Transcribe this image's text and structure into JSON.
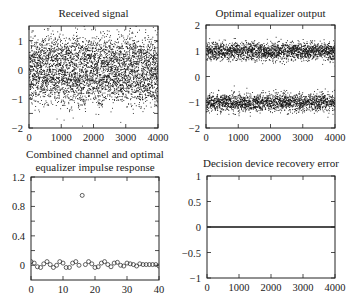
{
  "chart_data": [
    {
      "id": "received",
      "type": "scatter",
      "title": "Received signal",
      "xlabel": "",
      "ylabel": "",
      "xlim": [
        0,
        4000
      ],
      "ylim": [
        -2,
        1.5
      ],
      "xticks": [
        0,
        1000,
        2000,
        3000,
        4000
      ],
      "yticks": [
        -2,
        -1,
        0,
        1
      ],
      "xtick_labels": [
        "0",
        "1000",
        "2000",
        "3000",
        "4000"
      ],
      "ytick_labels": [
        "−2",
        "−1",
        "0",
        "1"
      ],
      "n_points": 4000,
      "description": "Dense cloud of dots centered near 0, mostly within about -1 to 1, occasional outliers to about -1.5 and 1.4",
      "approx_mean": 0,
      "approx_spread": [
        -1.3,
        1.4
      ],
      "grid": false,
      "legend": null
    },
    {
      "id": "equalizer_output",
      "type": "scatter",
      "title": "Optimal equalizer output",
      "xlabel": "",
      "ylabel": "",
      "xlim": [
        0,
        4000
      ],
      "ylim": [
        -2,
        2
      ],
      "xticks": [
        0,
        1000,
        2000,
        3000,
        4000
      ],
      "yticks": [
        -2,
        -1,
        0,
        1,
        2
      ],
      "xtick_labels": [
        "0",
        "1000",
        "2000",
        "3000",
        "4000"
      ],
      "ytick_labels": [
        "−2",
        "−1",
        "0",
        "1",
        "2"
      ],
      "n_points": 4000,
      "description": "Two dense bands centered at +1 and -1, each about ±0.4 wide",
      "band_centers": [
        1,
        -1
      ],
      "band_halfwidth": 0.4,
      "grid": false,
      "legend": null
    },
    {
      "id": "impulse_response",
      "type": "scatter",
      "title": "Combined channel and optimal equalizer impulse response",
      "title_lines": [
        "Combined channel and optimal",
        "equalizer impulse response"
      ],
      "xlabel": "",
      "ylabel": "",
      "xlim": [
        0,
        40
      ],
      "ylim": [
        -0.2,
        1.2
      ],
      "xticks": [
        0,
        10,
        20,
        30,
        40
      ],
      "yticks": [
        0,
        0.4,
        0.8,
        1.2
      ],
      "xtick_labels": [
        "0",
        "10",
        "20",
        "30",
        "40"
      ],
      "ytick_labels": [
        "0",
        "0.4",
        "0.8",
        "1.2"
      ],
      "x": [
        0,
        1,
        2,
        3,
        4,
        5,
        6,
        7,
        8,
        9,
        10,
        11,
        12,
        13,
        14,
        15,
        16,
        17,
        18,
        19,
        20,
        21,
        22,
        23,
        24,
        25,
        26,
        27,
        28,
        29,
        30,
        31,
        32,
        33,
        34,
        35,
        36,
        37,
        38,
        39,
        40
      ],
      "values": [
        0.05,
        0.03,
        -0.02,
        -0.03,
        0.02,
        0.05,
        0.01,
        -0.03,
        0.0,
        0.05,
        0.03,
        -0.03,
        -0.03,
        0.03,
        0.05,
        0.0,
        0.95,
        0.01,
        0.05,
        0.02,
        -0.03,
        -0.02,
        0.03,
        0.05,
        0.01,
        -0.02,
        0.03,
        0.04,
        0.0,
        -0.01,
        0.03,
        0.02,
        0.01,
        -0.01,
        0.02,
        0.01,
        0.01,
        0.01,
        0.01,
        0.01,
        -0.01
      ],
      "marker": "open-circle",
      "grid": false,
      "legend": null
    },
    {
      "id": "recovery_error",
      "type": "line",
      "title": "Decision device recovery error",
      "xlabel": "",
      "ylabel": "",
      "xlim": [
        0,
        4000
      ],
      "ylim": [
        -1,
        1
      ],
      "xticks": [
        0,
        1000,
        2000,
        3000,
        4000
      ],
      "yticks": [
        -1,
        -0.5,
        0,
        0.5,
        1
      ],
      "xtick_labels": [
        "0",
        "1000",
        "2000",
        "3000",
        "4000"
      ],
      "ytick_labels": [
        "−1",
        "−0.5",
        "0",
        "0.5",
        "1"
      ],
      "x": [
        0,
        4000
      ],
      "values": [
        0,
        0
      ],
      "description": "Flat line at zero error across all 4000 samples",
      "grid": false,
      "legend": null
    }
  ]
}
